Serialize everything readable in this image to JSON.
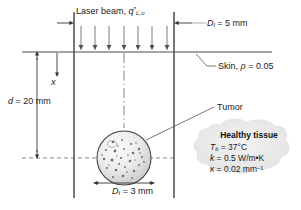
{
  "figure": {
    "background_color": "#ffffff",
    "line_color": "#4d4d4d",
    "text_color": "#1a1a1a"
  },
  "labels": {
    "laser_beam": "Laser beam,",
    "laser_flux_symbol": "q",
    "laser_flux_prime": "″",
    "laser_flux_subscript": "L,o",
    "laser_diameter_symbol": "D",
    "laser_diameter_subscript": "l",
    "laser_diameter_value": " = 5 mm",
    "skin": "Skin, ",
    "skin_rho_symbol": "ρ",
    "skin_rho_value": " = 0.05",
    "depth_symbol": "d",
    "depth_value": " = 20 mm",
    "coordinate_x": "x",
    "tumor": "Tumor",
    "tumor_diameter_symbol": "D",
    "tumor_diameter_subscript": "t",
    "tumor_diameter_value": " = 3 mm"
  },
  "tissue_box": {
    "title": "Healthy tissue",
    "rows": [
      {
        "symbol": "T",
        "subscript": "b",
        "value": " = 37°C"
      },
      {
        "symbol": "k",
        "subscript": "",
        "value": " = 0.5 W/m•K"
      },
      {
        "symbol": "κ",
        "subscript": "",
        "value": " = 0.02 mm",
        "superscript": "–1"
      }
    ]
  },
  "geometry": {
    "skin_surface_y": 52,
    "beam_left_x": 74,
    "beam_right_x": 174,
    "centerline_x": 124,
    "tumor_center_x": 124,
    "tumor_center_y": 158,
    "tumor_radius": 27,
    "arrow_count": 7
  }
}
